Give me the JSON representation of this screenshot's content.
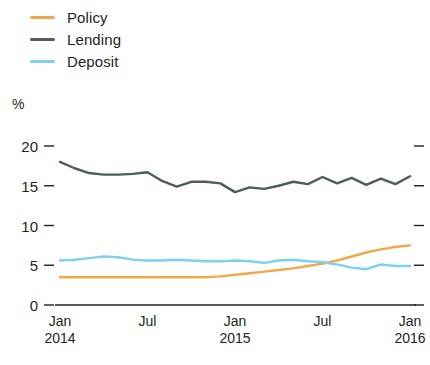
{
  "legend": {
    "position": "top-left",
    "items": [
      {
        "label": "Policy",
        "color": "#f0a94a",
        "key": "policy"
      },
      {
        "label": "Lending",
        "color": "#4a6050",
        "key": "lending"
      },
      {
        "label": "Deposit",
        "color": "#7ed0f0",
        "key": "deposit"
      }
    ]
  },
  "axes": {
    "unit_label": "%",
    "y_ticks": [
      "20",
      "15",
      "10",
      "5",
      "0"
    ],
    "x_ticks": [
      {
        "month": "Jan",
        "year": "2014"
      },
      {
        "month": "Jul",
        "year": ""
      },
      {
        "month": "Jan",
        "year": "2015"
      },
      {
        "month": "Jul",
        "year": ""
      },
      {
        "month": "Jan",
        "year": "2016"
      }
    ]
  },
  "chart_data": {
    "type": "line",
    "title": "",
    "subtitle": "",
    "xlabel": "",
    "ylabel": "%",
    "ylim": [
      0,
      20
    ],
    "y_ticks": [
      0,
      5,
      10,
      15,
      20
    ],
    "grid": false,
    "legend_position": "top-left",
    "x": [
      "Jan 2014",
      "Feb 2014",
      "Mar 2014",
      "Apr 2014",
      "May 2014",
      "Jun 2014",
      "Jul 2014",
      "Aug 2014",
      "Sep 2014",
      "Oct 2014",
      "Nov 2014",
      "Dec 2014",
      "Jan 2015",
      "Feb 2015",
      "Mar 2015",
      "Apr 2015",
      "May 2015",
      "Jun 2015",
      "Jul 2015",
      "Aug 2015",
      "Sep 2015",
      "Oct 2015",
      "Nov 2015",
      "Dec 2015",
      "Jan 2016"
    ],
    "x_tick_labels": [
      "Jan 2014",
      "Jul",
      "Jan 2015",
      "Jul",
      "Jan 2016"
    ],
    "x_tick_indices": [
      0,
      6,
      12,
      18,
      24
    ],
    "series": [
      {
        "name": "Policy",
        "color": "#f0a94a",
        "values": [
          3.5,
          3.5,
          3.5,
          3.5,
          3.5,
          3.5,
          3.5,
          3.5,
          3.5,
          3.5,
          3.5,
          3.6,
          3.8,
          4.0,
          4.2,
          4.4,
          4.6,
          4.9,
          5.2,
          5.6,
          6.1,
          6.6,
          7.0,
          7.3,
          7.5
        ]
      },
      {
        "name": "Lending",
        "color": "#4a6050",
        "values": [
          18.0,
          17.2,
          16.6,
          16.4,
          16.4,
          16.5,
          16.7,
          15.6,
          14.9,
          15.5,
          15.5,
          15.3,
          14.2,
          14.8,
          14.6,
          15.0,
          15.5,
          15.2,
          16.1,
          15.3,
          16.0,
          15.1,
          15.9,
          15.2,
          16.2
        ]
      },
      {
        "name": "Deposit",
        "color": "#7ed0f0",
        "values": [
          5.6,
          5.7,
          5.9,
          6.1,
          6.0,
          5.7,
          5.6,
          5.6,
          5.7,
          5.6,
          5.5,
          5.5,
          5.6,
          5.5,
          5.3,
          5.6,
          5.7,
          5.5,
          5.4,
          5.1,
          4.7,
          4.5,
          5.1,
          4.9,
          4.9
        ]
      }
    ]
  }
}
